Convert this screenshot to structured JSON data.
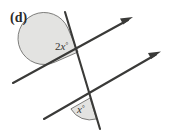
{
  "figure": {
    "part_label": "(d)",
    "background_color": "#ffffff",
    "line_color": "#3a3a38",
    "sector_fill_color": "#e3e3e1",
    "sector_stroke_color": "#6f6f6d",
    "text_color": "#33332f",
    "angles": [
      {
        "id": "upper-angle",
        "label_prefix": "2",
        "label_variable": "x",
        "label_degree": "°",
        "label_full": "2x°",
        "label_x": 57,
        "label_y": 47,
        "vertex_x": 78,
        "vertex_y": 52,
        "arc_radius": 26
      },
      {
        "id": "lower-angle",
        "label_prefix": "",
        "label_variable": "x",
        "label_degree": "°",
        "label_full": "x°",
        "label_x": 79,
        "label_y": 112,
        "vertex_x": 90,
        "vertex_y": 98,
        "arc_radius": 22
      }
    ],
    "lines": [
      {
        "id": "parallel-line-upper",
        "type": "ray-with-arrow",
        "x1": 13,
        "y1": 83,
        "x2": 132,
        "y2": 18,
        "arrow_at": "end"
      },
      {
        "id": "parallel-line-lower",
        "type": "ray-with-arrow",
        "x1": 44,
        "y1": 119,
        "x2": 160,
        "y2": 52,
        "arrow_at": "end"
      },
      {
        "id": "transversal-line",
        "type": "segment",
        "x1": 65,
        "y1": 12,
        "x2": 100,
        "y2": 129,
        "arrow_at": "none"
      }
    ]
  }
}
